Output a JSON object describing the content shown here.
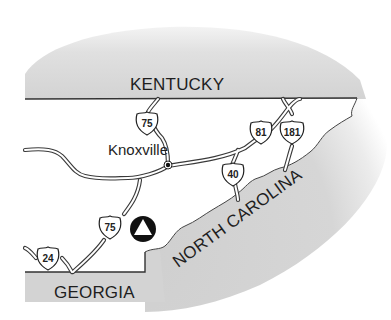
{
  "map": {
    "title": "East Tennessee regional location map",
    "colors": {
      "background": "#ffffff",
      "neighbor_state_fill": "#d4d4d4",
      "neighbor_state_fill_light": "#efefef",
      "border_line": "#333333",
      "road_outline": "#444444",
      "road_fill": "#ffffff",
      "marker": "#111111"
    },
    "states": [
      {
        "id": "kentucky",
        "label": "KENTUCKY"
      },
      {
        "id": "georgia",
        "label": "GEORGIA"
      },
      {
        "id": "north-carolina",
        "label": "NORTH CAROLINA"
      }
    ],
    "cities": [
      {
        "id": "knoxville",
        "label": "Knoxville"
      }
    ],
    "highways": [
      {
        "id": "i75-north",
        "label": "75",
        "type": "interstate"
      },
      {
        "id": "i81",
        "label": "81",
        "type": "interstate"
      },
      {
        "id": "i181",
        "label": "181",
        "type": "interstate"
      },
      {
        "id": "i40",
        "label": "40",
        "type": "interstate"
      },
      {
        "id": "i75-south",
        "label": "75",
        "type": "interstate"
      },
      {
        "id": "i24",
        "label": "24",
        "type": "interstate"
      }
    ],
    "marker": {
      "id": "location-marker",
      "symbol": "triangle-in-circle"
    }
  }
}
